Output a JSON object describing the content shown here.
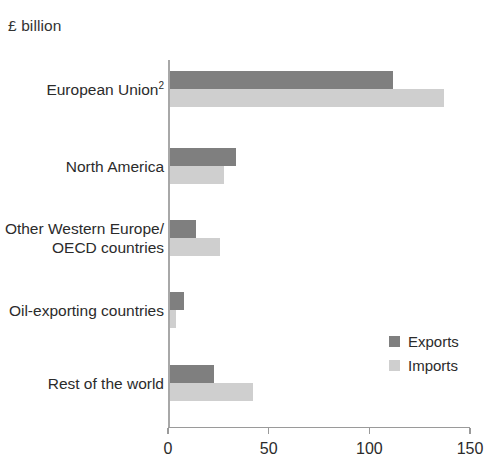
{
  "unit_label": "£ billion",
  "colors": {
    "exports": "#7f7f7f",
    "imports": "#cfcfcf",
    "axis": "#9a9a9a",
    "text": "#2b2b2b",
    "background": "#ffffff"
  },
  "legend": {
    "position": "bottom-right",
    "items": [
      {
        "label": "Exports",
        "color": "#7f7f7f"
      },
      {
        "label": "Imports",
        "color": "#cfcfcf"
      }
    ]
  },
  "axis": {
    "ticks": [
      {
        "label": "0",
        "value": 0
      },
      {
        "label": "50",
        "value": 50
      },
      {
        "label": "100",
        "value": 100
      },
      {
        "label": "150",
        "value": 150
      }
    ]
  },
  "categories_display": [
    {
      "line1": "European Union",
      "sup": "2",
      "line2": ""
    },
    {
      "line1": "North America",
      "sup": "",
      "line2": ""
    },
    {
      "line1": "Other Western Europe/",
      "sup": "",
      "line2": "OECD countries"
    },
    {
      "line1": "Oil-exporting countries",
      "sup": "",
      "line2": ""
    },
    {
      "line1": "Rest of the world",
      "sup": "",
      "line2": ""
    }
  ],
  "chart_data": {
    "type": "bar",
    "orientation": "horizontal",
    "title": "",
    "subtitle": "",
    "xlabel": "£ billion",
    "ylabel": "",
    "xlim": [
      0,
      150
    ],
    "xticks": [
      0,
      50,
      100,
      150
    ],
    "grid": false,
    "legend_position": "bottom-right",
    "categories": [
      "European Union²",
      "North America",
      "Other Western Europe/OECD countries",
      "Oil-exporting countries",
      "Rest of the world"
    ],
    "series": [
      {
        "name": "Exports",
        "color": "#7f7f7f",
        "values": [
          111,
          33,
          13,
          7,
          22
        ]
      },
      {
        "name": "Imports",
        "color": "#cfcfcf",
        "values": [
          136,
          27,
          25,
          3,
          41
        ]
      }
    ]
  }
}
